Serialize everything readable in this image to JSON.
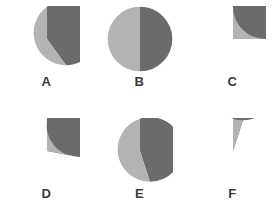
{
  "figure": {
    "background_color": "#ffffff",
    "rows": 2,
    "columns": 3
  },
  "colors": {
    "major_slice": "#6b6b6b",
    "minor_slice": "#b3b3b3",
    "label_text": "#3a3a3a",
    "background": "#ffffff"
  },
  "chart_data": [
    {
      "type": "pie",
      "title": "A",
      "labels": [
        "dark",
        "light"
      ],
      "values": [
        60,
        40
      ],
      "colors": [
        "#6b6b6b",
        "#b3b3b3"
      ],
      "start_angle_deg": 0,
      "direction": "counterclockwise",
      "minor_fraction_pct": 40,
      "legend": "none",
      "grid": false
    },
    {
      "type": "pie",
      "title": "B",
      "labels": [
        "dark",
        "light"
      ],
      "values": [
        50,
        50
      ],
      "colors": [
        "#6b6b6b",
        "#b3b3b3"
      ],
      "start_angle_deg": 0,
      "direction": "counterclockwise",
      "minor_fraction_pct": 50,
      "legend": "none",
      "grid": false
    },
    {
      "type": "pie",
      "title": "C",
      "labels": [
        "dark",
        "light"
      ],
      "values": [
        75,
        25
      ],
      "colors": [
        "#6b6b6b",
        "#b3b3b3"
      ],
      "start_angle_deg": 0,
      "direction": "counterclockwise",
      "minor_fraction_pct": 25,
      "legend": "none",
      "grid": false
    },
    {
      "type": "pie",
      "title": "D",
      "labels": [
        "dark",
        "light"
      ],
      "values": [
        72,
        28
      ],
      "colors": [
        "#6b6b6b",
        "#b3b3b3"
      ],
      "start_angle_deg": 0,
      "direction": "counterclockwise",
      "minor_fraction_pct": 28,
      "legend": "none",
      "grid": false
    },
    {
      "type": "pie",
      "title": "E",
      "labels": [
        "dark",
        "light"
      ],
      "values": [
        55,
        45
      ],
      "colors": [
        "#6b6b6b",
        "#b3b3b3"
      ],
      "start_angle_deg": 0,
      "direction": "counterclockwise",
      "minor_fraction_pct": 45,
      "legend": "none",
      "grid": false
    },
    {
      "type": "pie",
      "title": "F",
      "labels": [
        "dark",
        "light"
      ],
      "values": [
        95,
        5
      ],
      "colors": [
        "#6b6b6b",
        "#b3b3b3"
      ],
      "start_angle_deg": 0,
      "direction": "counterclockwise",
      "minor_fraction_pct": 5,
      "legend": "none",
      "grid": false
    }
  ],
  "labels": {
    "a": "A",
    "b": "B",
    "c": "C",
    "d": "D",
    "e": "E",
    "f": "F"
  }
}
